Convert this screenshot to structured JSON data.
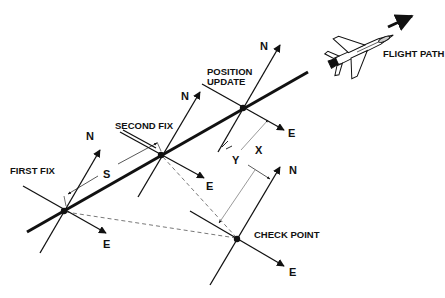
{
  "diagram": {
    "labels": {
      "first_fix": "FIRST FIX",
      "second_fix": "SECOND FIX",
      "position_update_line1": "POSITION",
      "position_update_line2": "UPDATE",
      "check_point": "CHECK POINT",
      "flight_path": "FLIGHT PATH",
      "distance_s": "S",
      "offset_x": "X",
      "offset_y": "Y",
      "north": "N",
      "east": "E"
    },
    "nodes": [
      {
        "id": "first-fix",
        "label": "FIRST FIX",
        "x": 64,
        "y": 211
      },
      {
        "id": "second-fix",
        "label": "SECOND FIX",
        "x": 161,
        "y": 155
      },
      {
        "id": "position-update",
        "label": "POSITION UPDATE",
        "x": 243,
        "y": 108
      },
      {
        "id": "check-point",
        "label": "CHECK POINT",
        "x": 237,
        "y": 239
      }
    ],
    "edges": [
      {
        "from": "first-fix",
        "to": "position-update",
        "style": "thick-solid",
        "label": "flight path"
      },
      {
        "from": "first-fix",
        "to": "check-point",
        "style": "dashed"
      },
      {
        "from": "second-fix",
        "to": "check-point",
        "style": "dashed"
      },
      {
        "from": "first-fix",
        "to": "second-fix",
        "style": "dimension",
        "label": "S"
      },
      {
        "from": "position-update",
        "to": "check-point",
        "style": "dimension",
        "label": "X"
      },
      {
        "from": "position-update",
        "to": "check-point",
        "style": "dimension",
        "label": "Y"
      }
    ],
    "colors": {
      "ink": "#111111",
      "background": "#ffffff"
    }
  }
}
